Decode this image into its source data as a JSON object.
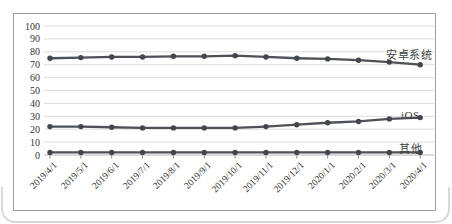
{
  "chart_data": {
    "type": "line",
    "title": "",
    "xlabel": "",
    "ylabel": "",
    "ylim": [
      0,
      100
    ],
    "ytick_step": 10,
    "yticks": [
      "100",
      "90",
      "80",
      "70",
      "60",
      "50",
      "40",
      "30",
      "20",
      "10",
      "0"
    ],
    "grid": "horizontal",
    "legend_position": "end-of-line-labels",
    "categories": [
      "2019/4/1",
      "2019/5/1",
      "2019/6/1",
      "2019/7/1",
      "2019/8/1",
      "2019/9/1",
      "2019/10/1",
      "2019/11/1",
      "2019/12/1",
      "2020/1/1",
      "2020/2/1",
      "2020/3/1",
      "2020/4/1"
    ],
    "series": [
      {
        "name": "安卓系统",
        "values": [
          75,
          75.5,
          76,
          76,
          76.5,
          76.5,
          77,
          76,
          75,
          74.5,
          73.5,
          72,
          70
        ]
      },
      {
        "name": "iOS",
        "values": [
          22,
          22,
          21.5,
          21,
          21,
          21,
          21,
          22,
          23.5,
          25,
          26,
          28,
          29
        ]
      },
      {
        "name": "其他",
        "values": [
          2,
          2,
          2,
          2,
          2,
          2,
          2,
          2,
          2,
          2,
          2,
          2,
          2
        ]
      }
    ],
    "colors": {
      "line": "#4e5155",
      "marker": "#43464a",
      "gridline": "#dcdcdc",
      "axis": "#b5b5b5",
      "tick": "#8e8e8e",
      "frame_border": "#9f9f9f",
      "text": "#333333"
    }
  }
}
